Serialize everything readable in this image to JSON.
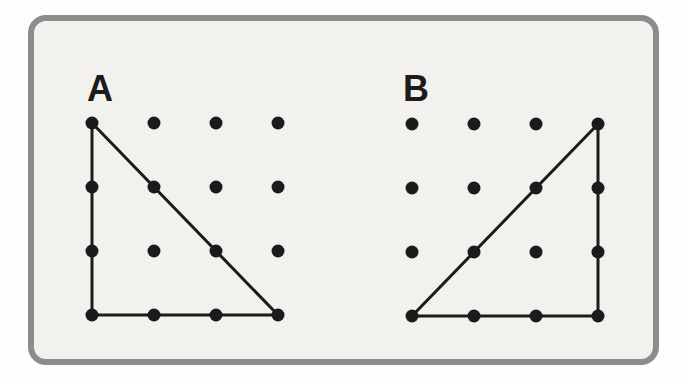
{
  "page": {
    "background": "#fdfdfc"
  },
  "card": {
    "background": "#f2f1ed",
    "border_color": "#8c8c8c"
  },
  "colors": {
    "ink": "#1b1b1b"
  },
  "stroke_width": 3,
  "figures": [
    {
      "label": "A",
      "origin_x": 92,
      "origin_y": 123,
      "spacing_x": 62,
      "spacing_y": 64,
      "cols": 4,
      "rows": 4,
      "dot_radius": 6.5,
      "triangle_vertices": [
        [
          0,
          0
        ],
        [
          3,
          3
        ],
        [
          0,
          3
        ]
      ]
    },
    {
      "label": "B",
      "origin_x": 412,
      "origin_y": 124,
      "spacing_x": 62,
      "spacing_y": 64,
      "cols": 4,
      "rows": 4,
      "dot_radius": 6.5,
      "triangle_vertices": [
        [
          0,
          3
        ],
        [
          3,
          0
        ],
        [
          3,
          3
        ]
      ]
    }
  ]
}
